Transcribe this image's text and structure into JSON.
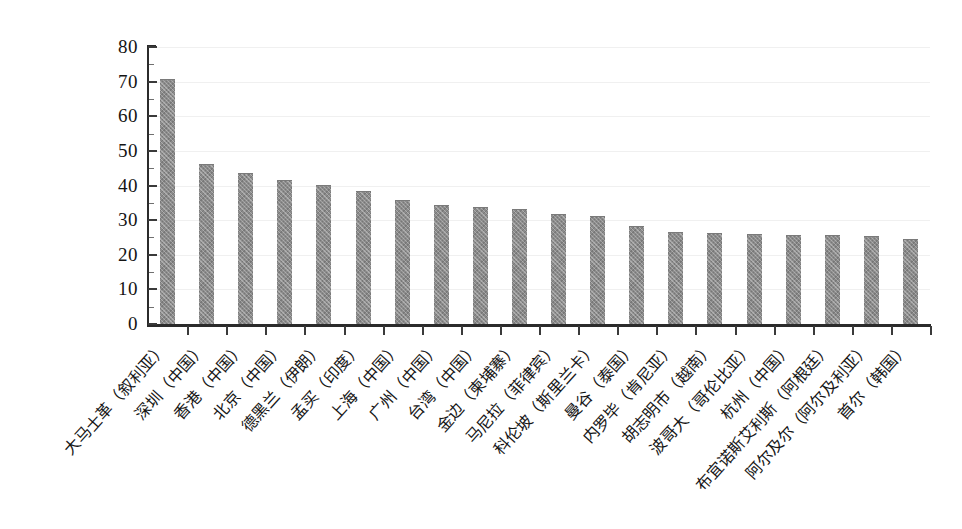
{
  "chart_data": {
    "type": "bar",
    "title": "",
    "subtitle": "",
    "xlabel": "",
    "ylabel": "",
    "ylim": [
      0,
      80
    ],
    "ytick_step": 10,
    "yticks": [
      "0",
      "10",
      "20",
      "30",
      "40",
      "50",
      "60",
      "70",
      "80"
    ],
    "grid": true,
    "grid_axis": "y",
    "legend": false,
    "legend_position": "none",
    "bar_color": "#8b8b8b",
    "axis_color": "#2b2b2b",
    "background": "#ffffff",
    "categories": [
      "大马士革（叙利亚）",
      "深圳（中国）",
      "香港（中国）",
      "北京（中国）",
      "德黑兰（伊朗）",
      "孟买（印度）",
      "上海（中国）",
      "广州（中国）",
      "台湾（中国）",
      "金边（柬埔寨）",
      "马尼拉（菲律宾）",
      "科伦坡（斯里兰卡）",
      "曼谷（泰国）",
      "内罗毕（肯尼亚）",
      "胡志明市（越南）",
      "波哥大（哥伦比亚）",
      "杭州（中国）",
      "布宜诺斯艾利斯（阿根廷）",
      "阿尔及尔（阿尔及利亚）",
      "首尔（韩国）"
    ],
    "values": [
      70.5,
      46.0,
      43.2,
      41.3,
      40.0,
      38.0,
      35.6,
      34.2,
      33.4,
      33.0,
      31.4,
      31.0,
      28.0,
      26.4,
      26.1,
      25.6,
      25.5,
      25.3,
      25.2,
      24.2
    ]
  }
}
